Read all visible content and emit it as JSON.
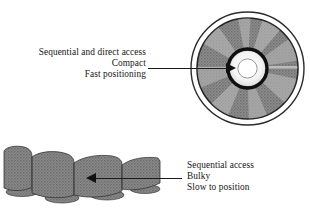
{
  "figure": {
    "background_color": "#ffffff"
  },
  "cd": {
    "icon_name": "compact-disc",
    "caption_lines": [
      "Sequential and direct access",
      "Compact",
      "Fast positioning"
    ],
    "colors": {
      "disc_fill": "#8d8d8d",
      "disc_highlight": "#b4b4b4",
      "outline": "#1b1b1b",
      "hub_ring": "#111111",
      "hub_fill": "#f2f2f2",
      "center_hole": "#ffffff"
    },
    "leader_arrow": {
      "name": "cd-leader-arrow",
      "direction": "right"
    }
  },
  "tape": {
    "icon_name": "fanfold-tape",
    "caption_lines": [
      "Sequential access",
      "Bulky",
      "Slow to position"
    ],
    "colors": {
      "fill": "#8a8a8a",
      "shade": "#6f6f6f",
      "outline": "#2a2a2a"
    },
    "leader_arrow": {
      "name": "tape-leader-arrow",
      "direction": "left"
    }
  }
}
